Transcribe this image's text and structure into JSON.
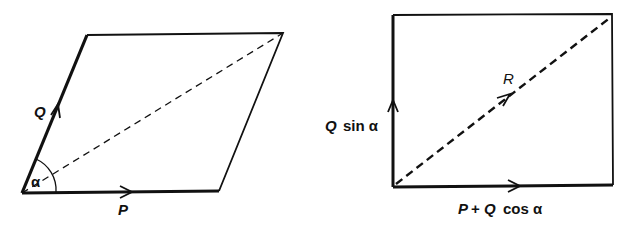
{
  "figures": {
    "parallelogram": {
      "vectors": {
        "Q": {
          "label": "Q"
        },
        "P": {
          "label": "P"
        }
      },
      "angle_label": "α",
      "diagonal": "dashed resultant (unlabeled)"
    },
    "rectangle": {
      "vertical_label_symbol": "Q",
      "vertical_label_fn": "sin α",
      "horizontal_label_P": "P",
      "horizontal_label_plus": "+",
      "horizontal_label_Q": "Q",
      "horizontal_label_fn": "cos α",
      "resultant_label": "R"
    }
  },
  "colors": {
    "stroke": "#111111",
    "background": "#ffffff"
  }
}
